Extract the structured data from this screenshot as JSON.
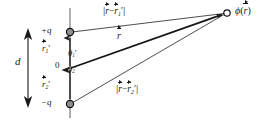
{
  "figure": {
    "kind": "electric-dipole-potential-diagram",
    "background_color": "#ffffff",
    "ink_color": "#1a1a1a"
  },
  "labels": {
    "charge_positive": "+q",
    "charge_negative": "−q",
    "origin": "0",
    "separation": "d",
    "source_vector_1": "r",
    "source_vector_1_sub": "1",
    "source_vector_1_prime": "′",
    "source_vector_2": "r",
    "source_vector_2_sub": "2",
    "source_vector_2_prime": "′",
    "angle_1": "θ",
    "angle_1_sub": "1",
    "angle_1_prime": "′",
    "angle_2": "θ",
    "angle_2_sub": "2",
    "angle_2_prime": "′",
    "field_vector": "r",
    "distance_1_open": "|",
    "distance_1_close": "|",
    "distance_1_lhs": "r",
    "distance_1_minus": "−",
    "distance_1_rhs": "r",
    "distance_1_rhs_sub": "1",
    "distance_1_rhs_prime": "′",
    "distance_2_open": "|",
    "distance_2_close": "|",
    "distance_2_lhs": "r",
    "distance_2_minus": "−",
    "distance_2_rhs": "r",
    "distance_2_rhs_sub": "2",
    "distance_2_rhs_prime": "′",
    "potential_symbol": "ϕ",
    "potential_open": "(",
    "potential_arg": "r",
    "potential_close": ")"
  },
  "geometry": {
    "axis_x": 70,
    "axis_top_y": 8,
    "axis_bottom_y": 118,
    "charge_pos_y": 32,
    "origin_y": 68,
    "charge_neg_y": 104,
    "field_point_x": 226,
    "field_point_y": 13,
    "d_arrow_x": 28,
    "d_arrow_top_y": 30,
    "d_arrow_bottom_y": 106
  }
}
